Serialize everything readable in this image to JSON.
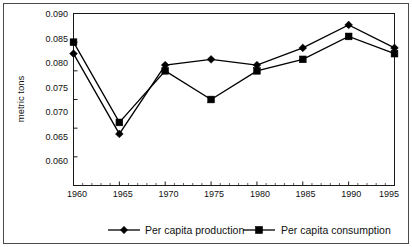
{
  "chart_data": {
    "type": "line",
    "title": "",
    "xlabel": "",
    "ylabel": "metric tons",
    "x": [
      1960,
      1965,
      1970,
      1975,
      1980,
      1985,
      1990,
      1995
    ],
    "categories": [
      "1960",
      "1965",
      "1970",
      "1975",
      "1980",
      "1985",
      "1990",
      "1995"
    ],
    "series": [
      {
        "name": "Per capita production",
        "marker": "diamond",
        "color": "#000000",
        "values": [
          0.083,
          0.069,
          0.081,
          0.082,
          0.081,
          0.084,
          0.088,
          0.084
        ]
      },
      {
        "name": "Per capita consumption",
        "marker": "square",
        "color": "#000000",
        "values": [
          0.085,
          0.071,
          0.08,
          0.075,
          0.08,
          0.082,
          0.086,
          0.083
        ]
      }
    ],
    "ylim": [
      0.06,
      0.09
    ],
    "xlim": [
      1960,
      1995
    ],
    "yticks": [
      0.06,
      0.065,
      0.07,
      0.075,
      0.08,
      0.085,
      0.09
    ],
    "ytick_labels": [
      "0.060",
      "0.065",
      "0.070",
      "0.075",
      "0.080",
      "0.085",
      "0.090"
    ],
    "xticks": [
      1960,
      1965,
      1970,
      1975,
      1980,
      1985,
      1990,
      1995
    ],
    "xtick_labels": [
      "1960",
      "1965",
      "1970",
      "1975",
      "1980",
      "1985",
      "1990",
      "1995"
    ],
    "grid": false,
    "legend_position": "bottom",
    "legend": [
      "Per capita production",
      "Per capita consumption"
    ]
  },
  "axes": {
    "y_axis_label": "metric tons",
    "y_tick_0": "0.090",
    "y_tick_1": "0.085",
    "y_tick_2": "0.080",
    "y_tick_3": "0.075",
    "y_tick_4": "0.070",
    "y_tick_5": "0.065",
    "y_tick_6": "0.060",
    "x_tick_0": "1960",
    "x_tick_1": "1965",
    "x_tick_2": "1970",
    "x_tick_3": "1975",
    "x_tick_4": "1980",
    "x_tick_5": "1985",
    "x_tick_6": "1990",
    "x_tick_7": "1995"
  },
  "legend": {
    "item_production": "Per capita production",
    "item_consumption": "Per capita consumption"
  }
}
